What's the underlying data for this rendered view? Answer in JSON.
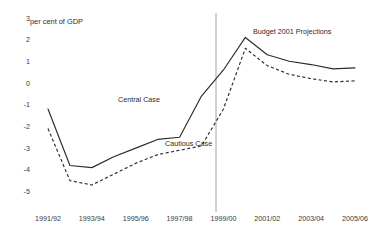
{
  "chart_data": {
    "type": "line",
    "title": "",
    "xlabel": "",
    "ylabel": "per cent of GDP",
    "ylim": [
      -5,
      3
    ],
    "xlim": [
      "1991/92",
      "2005/06"
    ],
    "grid": false,
    "legend": "inline-annotations",
    "y_ticks": [
      3,
      2,
      1,
      0,
      -1,
      -2,
      -3,
      -4,
      -5
    ],
    "y_tick_labels": [
      "3",
      "2",
      "1",
      "0",
      "-1",
      "-2",
      "-3",
      "-4",
      "-5"
    ],
    "x": [
      "1991/92",
      "1992/93",
      "1993/94",
      "1994/95",
      "1995/96",
      "1996/97",
      "1997/98",
      "1998/99",
      "1999/00",
      "2000/01",
      "2001/02",
      "2002/03",
      "2003/04",
      "2004/05",
      "2005/06"
    ],
    "x_tick_labels": [
      "1991/92",
      "1993/94",
      "1995/96",
      "1997/98",
      "1999/00",
      "2001/02",
      "2003/04",
      "2005/06"
    ],
    "x_tick_indices": [
      0,
      2,
      4,
      6,
      8,
      10,
      12,
      14
    ],
    "series": [
      {
        "name": "Central Case",
        "style": "solid",
        "color": "#2b2b2b",
        "values": [
          -1.2,
          -3.8,
          -3.9,
          -3.4,
          -3.0,
          -2.6,
          -2.5,
          -0.6,
          0.6,
          2.1,
          1.3,
          1.0,
          0.85,
          0.65,
          0.7
        ]
      },
      {
        "name": "Cautious Case",
        "style": "dashed",
        "color": "#2b2b2b",
        "values": [
          -2.1,
          -4.5,
          -4.7,
          -4.2,
          -3.7,
          -3.3,
          -3.1,
          -2.9,
          -1.2,
          1.6,
          0.8,
          0.4,
          0.2,
          0.05,
          0.1
        ]
      }
    ],
    "annotations": [
      {
        "id": "y-axis-note",
        "text": "per cent of GDP",
        "x_px": 30,
        "y_px": 24
      },
      {
        "id": "central-case-label",
        "text": "Central Case",
        "x_px": 118,
        "y_px": 102
      },
      {
        "id": "cautious-case-label",
        "text": "Cautious Case",
        "x_px": 165,
        "y_px": 146
      },
      {
        "id": "projection-label",
        "text": "Budget 2001 Projections",
        "x_px": 253,
        "y_px": 34
      }
    ],
    "vertical_divider": {
      "id": "projection-divider",
      "at_x_label": "2000/01",
      "x_px": 216,
      "y_top_px": 13,
      "y_bottom_px": 212,
      "color": "#9a9a9a"
    },
    "geometry": {
      "plot_left_px": 48,
      "plot_right_px": 355,
      "y_value_0_px": 83.0,
      "px_per_unit": 21.7
    }
  }
}
